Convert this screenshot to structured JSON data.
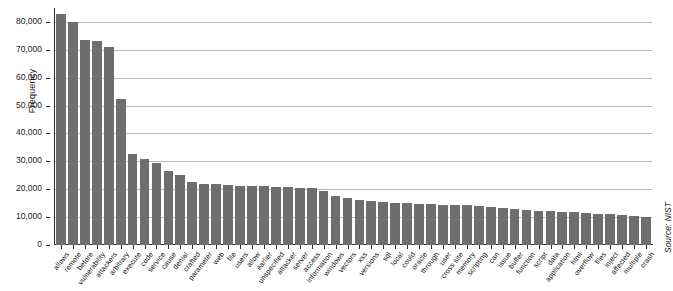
{
  "chart_data": {
    "type": "bar",
    "title": "",
    "subtitle": "",
    "xlabel": "",
    "ylabel": "Frequency",
    "ylim": [
      0,
      85000
    ],
    "ytick_labels": [
      "0",
      "10,000",
      "20,000",
      "30,000",
      "40,000",
      "50,000",
      "60,000",
      "70,000",
      "80,000"
    ],
    "ytick_values": [
      0,
      10000,
      20000,
      30000,
      40000,
      50000,
      60000,
      70000,
      80000
    ],
    "grid": true,
    "grid_axis": "y",
    "legend": false,
    "bar_color": "#6e6e6e",
    "annotation": "Source: NIST",
    "categories": [
      "allows",
      "remote",
      "before",
      "vulnerability",
      "attackers",
      "arbitrary",
      "execute",
      "code",
      "service",
      "cause",
      "denial",
      "crafted",
      "parameter",
      "web",
      "file",
      "users",
      "allow",
      "earlier",
      "unspecified",
      "attacker",
      "server",
      "access",
      "information",
      "windows",
      "vectors",
      "xss",
      "versions",
      "sql",
      "local",
      "could",
      "oracle",
      "through",
      "user",
      "cross site",
      "memory",
      "scripting",
      "can",
      "issue",
      "buffer",
      "function",
      "script",
      "data",
      "application",
      "html",
      "overflow",
      "files",
      "inject",
      "affected",
      "multiple",
      "crash"
    ],
    "values": [
      83000,
      80000,
      73500,
      73000,
      71000,
      52500,
      32500,
      31000,
      29500,
      26500,
      25000,
      22500,
      22000,
      21800,
      21500,
      21300,
      21200,
      21000,
      20900,
      20800,
      20600,
      20400,
      19500,
      17500,
      17000,
      16000,
      15800,
      15500,
      15200,
      15000,
      14800,
      14700,
      14500,
      14400,
      14300,
      14100,
      13800,
      13300,
      12800,
      12600,
      12300,
      12100,
      11900,
      11700,
      11500,
      11300,
      11000,
      10800,
      10400,
      10000
    ]
  },
  "figure": {
    "source_note": "Source: NIST",
    "y_axis_title": "Frequency"
  }
}
